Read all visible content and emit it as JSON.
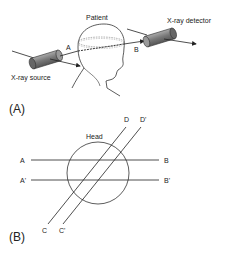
{
  "panel_a": {
    "label": "(A)",
    "patient_label": "Patient",
    "source_label": "X-ray source",
    "detector_label": "X-ray detector",
    "point_a": "A",
    "point_b": "B"
  },
  "panel_b": {
    "label": "(B)",
    "head_label": "Head",
    "lines": [
      {
        "start": "A",
        "end": "B"
      },
      {
        "start": "A'",
        "end": "B'"
      },
      {
        "start": "C",
        "end": "D"
      },
      {
        "start": "C'",
        "end": "D'"
      }
    ]
  },
  "colors": {
    "line": "#222222",
    "cylinder_fill": "#8a8a8a",
    "cylinder_dark": "#5a5a5a"
  }
}
